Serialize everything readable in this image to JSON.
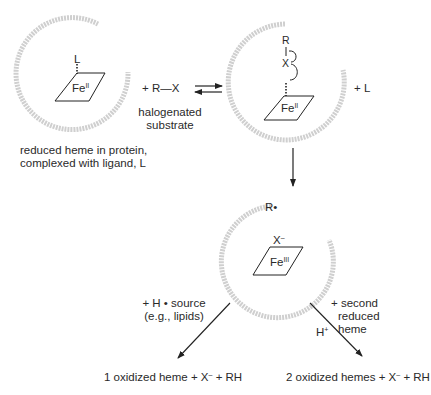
{
  "colors": {
    "line": "#222222",
    "protein_arc": "#c8c8c8",
    "text": "#2a2a2a"
  },
  "step1": {
    "ligand": "L",
    "iron_symbol": "Fe",
    "iron_ox": "II",
    "caption_line1": "reduced heme in protein,",
    "caption_line2": "complexed with ligand, L"
  },
  "reagent": {
    "label": "+ R—X",
    "caption_line1": "halogenated",
    "caption_line2": "substrate"
  },
  "step2": {
    "r_atom": "R",
    "x_atom": "X",
    "iron_symbol": "Fe",
    "iron_ox": "II",
    "released": "+  L"
  },
  "step3": {
    "radical": "R•",
    "halide": "X",
    "halide_charge": "–",
    "iron_symbol": "Fe",
    "iron_ox": "III"
  },
  "left_branch": {
    "condition_line1": "+ H • source",
    "condition_line2": "(e.g., lipids)",
    "product": "1 oxidized heme  +  X",
    "product_charge": "–",
    "product_tail": " + RH"
  },
  "right_branch": {
    "condition_line1": "+ second",
    "condition_line2": "reduced",
    "condition_line3": "heme",
    "proton": "H",
    "proton_charge": "+",
    "product": "2 oxidized hemes  +  X",
    "product_charge": "–",
    "product_tail": " + RH"
  }
}
